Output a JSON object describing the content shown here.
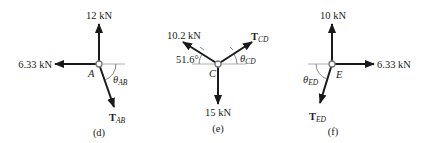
{
  "diagrams": [
    {
      "id": "d",
      "caption": "(d)",
      "joint": "A",
      "forces": [
        {
          "label": "12 kN",
          "direction": "up"
        },
        {
          "label": "6.33 kN",
          "direction": "left"
        },
        {
          "label_main": "T",
          "label_sub": "AB",
          "direction": "down-right"
        }
      ],
      "angle": {
        "symbol": "θ",
        "sub": "AB"
      }
    },
    {
      "id": "e",
      "caption": "(e)",
      "joint": "C",
      "forces": [
        {
          "label": "10.2 kN",
          "direction": "up-left"
        },
        {
          "label_main": "T",
          "label_sub": "CD",
          "direction": "up-right"
        },
        {
          "label": "15 kN",
          "direction": "down"
        }
      ],
      "angle_left": {
        "label": "51.6°"
      },
      "angle_right": {
        "symbol": "θ",
        "sub": "CD"
      }
    },
    {
      "id": "f",
      "caption": "(f)",
      "joint": "E",
      "forces": [
        {
          "label": "10 kN",
          "direction": "up"
        },
        {
          "label": "6.33 kN",
          "direction": "right"
        },
        {
          "label_main": "T",
          "label_sub": "ED",
          "direction": "down-left"
        }
      ],
      "angle": {
        "symbol": "θ",
        "sub": "ED"
      }
    }
  ],
  "colors": {
    "force": "#1a1a1a",
    "reference_line": "#9a9a9a",
    "joint": "#777777"
  }
}
